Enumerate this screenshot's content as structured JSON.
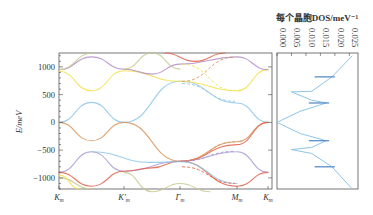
{
  "chart_data": [
    {
      "type": "line",
      "title": "",
      "xlabel": "",
      "ylabel": "E/meV",
      "ylim": [
        -1200,
        1250
      ],
      "yticks": [
        -1000,
        -500,
        0,
        500,
        1000
      ],
      "ytick_labels": [
        "−1000",
        "−500",
        "0",
        "500",
        "1000"
      ],
      "x_ticks": [
        "Km",
        "K'm",
        "Γm",
        "Mm",
        "Km"
      ],
      "x_tick_labels": [
        {
          "base": "K",
          "sub": "m",
          "prime": false
        },
        {
          "base": "K",
          "sub": "m",
          "prime": true
        },
        {
          "base": "Γ",
          "sub": "m",
          "prime": false
        },
        {
          "base": "M",
          "sub": "m",
          "prime": false
        },
        {
          "base": "K",
          "sub": "m",
          "prime": false
        }
      ],
      "grid": false,
      "series": [
        {
          "name": "blue band (Dirac)",
          "color": "#8ec5e8",
          "points": [
            [
              "Km",
              0
            ],
            [
              "0.5",
              360
            ],
            [
              "K'm",
              0
            ],
            [
              "Γm",
              740
            ],
            [
              "Mm",
              350
            ],
            [
              "Km",
              0
            ]
          ]
        },
        {
          "name": "orange band lower",
          "color": "#d9955a",
          "points": [
            [
              "Km",
              0
            ],
            [
              "0.5",
              -330
            ],
            [
              "K'm",
              0
            ],
            [
              "Γm",
              -700
            ],
            [
              "Mm",
              -350
            ],
            [
              "Km",
              0
            ]
          ]
        },
        {
          "name": "yellow band upper",
          "color": "#f2e14a",
          "points": [
            [
              "Km",
              920
            ],
            [
              "0.5",
              570
            ],
            [
              "K'm",
              930
            ],
            [
              "Γm",
              740
            ],
            [
              "Mm",
              570
            ],
            [
              "Km",
              950
            ]
          ]
        },
        {
          "name": "purple band upper",
          "color": "#b48cc8",
          "points": [
            [
              "Km",
              950
            ],
            [
              "0.5",
              1180
            ],
            [
              "K'm",
              960
            ],
            [
              "1.5",
              870
            ],
            [
              "Γm",
              1050
            ],
            [
              "Mm",
              1180
            ],
            [
              "Km",
              950
            ]
          ]
        },
        {
          "name": "purple band lower",
          "color": "#a99bd6",
          "points": [
            [
              "Km",
              -900
            ],
            [
              "0.5",
              -530
            ],
            [
              "K'm",
              -880
            ],
            [
              "Γm",
              -700
            ],
            [
              "Mm",
              -530
            ],
            [
              "Km",
              -900
            ]
          ]
        },
        {
          "name": "red band lower",
          "color": "#e0604a",
          "points": [
            [
              "Km",
              -900
            ],
            [
              "0.5",
              -1150
            ],
            [
              "K'm",
              -880
            ],
            [
              "1.5",
              -820
            ],
            [
              "Γm",
              -700
            ],
            [
              "Mm",
              -1150
            ],
            [
              "Km",
              -900
            ]
          ]
        }
      ]
    },
    {
      "type": "line",
      "title": "每个晶胞DOS/meV⁻¹",
      "xlabel": "每个晶胞DOS/meV⁻¹",
      "xticks": [
        0.0,
        0.005,
        0.01,
        0.015,
        0.02,
        0.025
      ],
      "xtick_labels": [
        "0.000",
        "0.005",
        "0.010",
        "0.015",
        "0.020",
        "0.025"
      ],
      "xlim": [
        0,
        0.028
      ],
      "ylim": [
        -1200,
        1250
      ],
      "orientation": "vertical",
      "color": "#8ec5e8",
      "points": [
        [
          0.026,
          1200
        ],
        [
          0.019,
          820
        ],
        [
          0.012,
          560
        ],
        [
          0.005,
          550
        ],
        [
          0.012,
          400
        ],
        [
          0.017,
          350
        ],
        [
          0.008,
          200
        ],
        [
          0.0,
          0
        ],
        [
          0.008,
          -200
        ],
        [
          0.017,
          -330
        ],
        [
          0.012,
          -450
        ],
        [
          0.005,
          -490
        ],
        [
          0.012,
          -560
        ],
        [
          0.019,
          -800
        ],
        [
          0.026,
          -1200
        ]
      ],
      "peaks": [
        {
          "E": 820,
          "dos": 0.019
        },
        {
          "E": 350,
          "dos": 0.017
        },
        {
          "E": -330,
          "dos": 0.017
        },
        {
          "E": -800,
          "dos": 0.019
        }
      ]
    }
  ]
}
